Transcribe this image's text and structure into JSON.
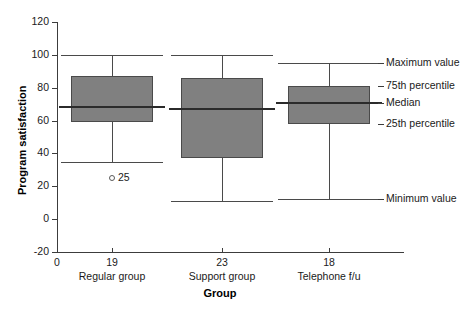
{
  "chart_data": {
    "type": "box",
    "title": "",
    "xlabel": "Group",
    "ylabel": "Program satisfaction",
    "ylim": [
      -20,
      120
    ],
    "yticks": [
      120,
      100,
      80,
      60,
      40,
      20,
      0,
      -20
    ],
    "xlim_label": "0",
    "grid": false,
    "legend_position": "right-annotations",
    "categories": [
      "Regular group",
      "Support group",
      "Telephone f/u"
    ],
    "counts": [
      19,
      23,
      18
    ],
    "boxes": [
      {
        "category": "Regular group",
        "count": 19,
        "minimum": 35,
        "q1": 59,
        "median": 68,
        "q3": 87,
        "maximum": 100,
        "outliers": [
          25
        ]
      },
      {
        "category": "Support group",
        "count": 23,
        "minimum": 11,
        "q1": 37,
        "median": 67,
        "q3": 86,
        "maximum": 100,
        "outliers": []
      },
      {
        "category": "Telephone f/u",
        "count": 18,
        "minimum": 12,
        "q1": 58,
        "median": 71,
        "q3": 81,
        "maximum": 95,
        "outliers": []
      }
    ],
    "annotations": [
      {
        "label": "Maximum value",
        "value": 95
      },
      {
        "label": "75th percentile",
        "value": 81
      },
      {
        "label": "Median",
        "value": 71
      },
      {
        "label": "25th percentile",
        "value": 58
      },
      {
        "label": "Minimum value",
        "value": 12
      }
    ],
    "colors": {
      "box_fill": "#808080",
      "box_stroke": "#4a4a4a",
      "median": "#2b2b2b",
      "axis": "#3c3c3c",
      "text": "#1a1a1a",
      "background": "#ffffff"
    }
  }
}
